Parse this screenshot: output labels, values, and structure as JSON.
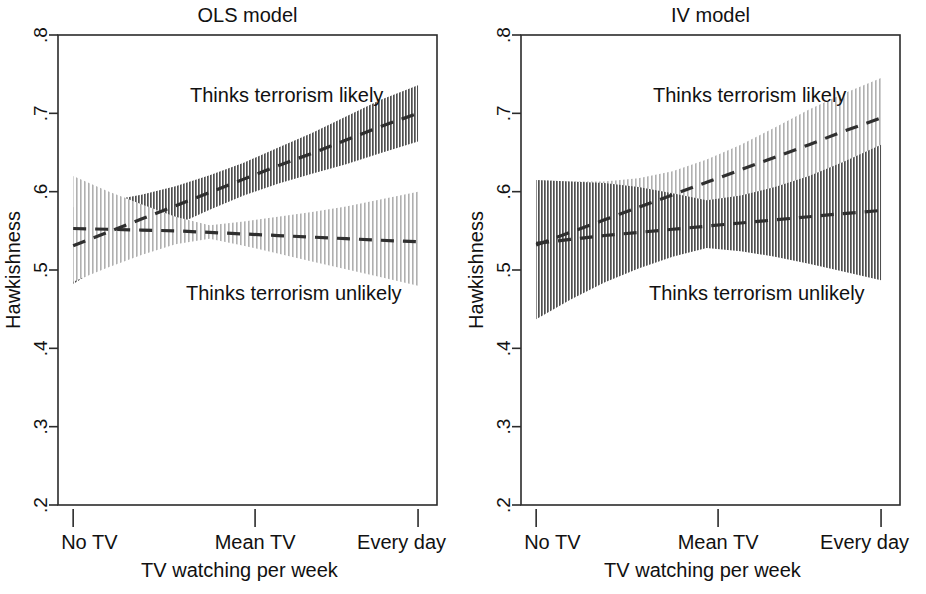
{
  "figure": {
    "width": 926,
    "height": 594,
    "background": "#ffffff",
    "ink_color": "#1a1a1a",
    "band_light_color": "#b9b9b9",
    "band_dark_color": "#6e6e6e",
    "line_color": "#2f2f2f"
  },
  "chart_data": [
    {
      "type": "line",
      "panel_id": "ols",
      "title": "OLS model",
      "xlabel": "TV watching per week",
      "ylabel": "Hawkishness",
      "grid": false,
      "legend_position": "inline-annotations",
      "ylim": [
        0.2,
        0.8
      ],
      "yticks": [
        0.2,
        0.3,
        0.4,
        0.5,
        0.6,
        0.7,
        0.8
      ],
      "ytick_labels": [
        ".2",
        ".3",
        ".4",
        ".5",
        ".6",
        ".7",
        ".8"
      ],
      "xlim": [
        0,
        100
      ],
      "xticks": [
        4,
        52,
        95
      ],
      "xtick_labels": [
        "No TV",
        "Mean TV",
        "Every day"
      ],
      "x": [
        4,
        13,
        22,
        31,
        40,
        49,
        58,
        67,
        76,
        85,
        95
      ],
      "series": [
        {
          "name": "Thinks terrorism likely",
          "annotation": "Thinks terrorism likely",
          "style": "dashed",
          "band_style": "dark-hatch",
          "values": [
            0.531,
            0.548,
            0.565,
            0.582,
            0.599,
            0.616,
            0.633,
            0.649,
            0.666,
            0.683,
            0.7
          ],
          "band_lower": [
            0.482,
            0.509,
            0.534,
            0.557,
            0.577,
            0.595,
            0.61,
            0.623,
            0.635,
            0.649,
            0.664
          ],
          "band_upper": [
            0.58,
            0.588,
            0.596,
            0.607,
            0.621,
            0.637,
            0.656,
            0.675,
            0.696,
            0.717,
            0.736
          ]
        },
        {
          "name": "Thinks terrorism unlikely",
          "annotation": "Thinks terrorism unlikely",
          "style": "dashed",
          "band_style": "light-hatch",
          "values": [
            0.553,
            0.552,
            0.551,
            0.55,
            0.548,
            0.546,
            0.544,
            0.542,
            0.54,
            0.538,
            0.536
          ],
          "band_lower": [
            0.485,
            0.503,
            0.519,
            0.533,
            0.54,
            0.531,
            0.521,
            0.511,
            0.501,
            0.491,
            0.48
          ],
          "band_upper": [
            0.62,
            0.601,
            0.584,
            0.568,
            0.557,
            0.562,
            0.568,
            0.574,
            0.581,
            0.59,
            0.6
          ]
        }
      ]
    },
    {
      "type": "line",
      "panel_id": "iv",
      "title": "IV model",
      "xlabel": "TV watching per week",
      "ylabel": "Hawkishness",
      "grid": false,
      "legend_position": "inline-annotations",
      "ylim": [
        0.2,
        0.8
      ],
      "yticks": [
        0.2,
        0.3,
        0.4,
        0.5,
        0.6,
        0.7,
        0.8
      ],
      "ytick_labels": [
        ".2",
        ".3",
        ".4",
        ".5",
        ".6",
        ".7",
        ".8"
      ],
      "xlim": [
        0,
        100
      ],
      "xticks": [
        4,
        52,
        95
      ],
      "xtick_labels": [
        "No TV",
        "Mean TV",
        "Every day"
      ],
      "x": [
        4,
        13,
        22,
        31,
        40,
        49,
        58,
        67,
        76,
        85,
        95
      ],
      "series": [
        {
          "name": "Thinks terrorism likely",
          "annotation": "Thinks terrorism likely",
          "style": "dashed",
          "band_style": "light-hatch",
          "values": [
            0.532,
            0.548,
            0.564,
            0.58,
            0.596,
            0.612,
            0.628,
            0.644,
            0.66,
            0.677,
            0.694
          ],
          "band_lower": [
            0.437,
            0.474,
            0.505,
            0.531,
            0.551,
            0.566,
            0.578,
            0.59,
            0.604,
            0.622,
            0.643
          ],
          "band_upper": [
            0.615,
            0.613,
            0.613,
            0.617,
            0.626,
            0.641,
            0.66,
            0.682,
            0.705,
            0.725,
            0.745
          ]
        },
        {
          "name": "Thinks terrorism unlikely",
          "annotation": "Thinks terrorism unlikely",
          "style": "dashed",
          "band_style": "dark-hatch",
          "values": [
            0.534,
            0.539,
            0.544,
            0.548,
            0.552,
            0.556,
            0.56,
            0.564,
            0.568,
            0.572,
            0.576
          ],
          "band_lower": [
            0.437,
            0.462,
            0.484,
            0.502,
            0.517,
            0.528,
            0.524,
            0.517,
            0.508,
            0.498,
            0.487
          ],
          "band_upper": [
            0.615,
            0.613,
            0.611,
            0.606,
            0.598,
            0.589,
            0.595,
            0.606,
            0.62,
            0.638,
            0.66
          ]
        }
      ]
    }
  ]
}
